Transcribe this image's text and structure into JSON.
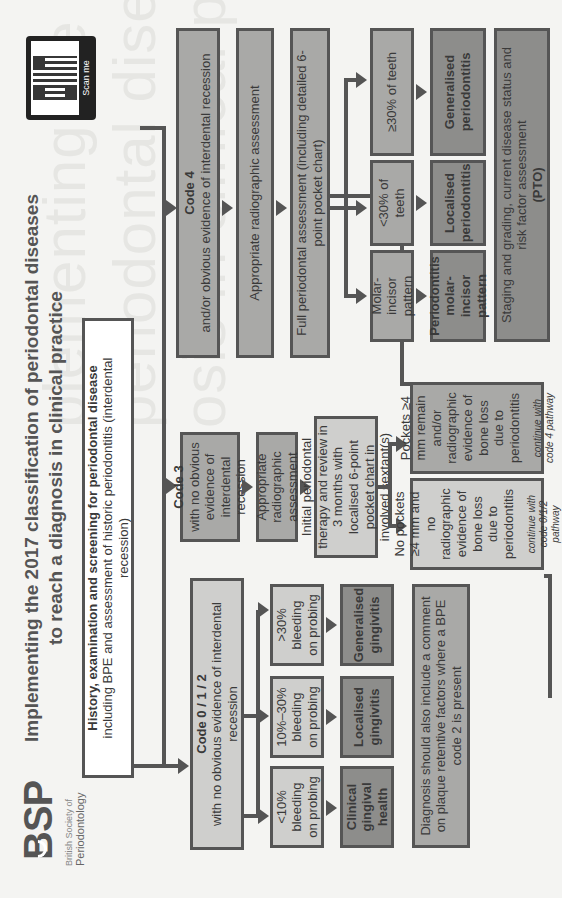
{
  "header": {
    "title_line1": "Implementing the 2017 classification of periodontal diseases",
    "title_line2": "to reach a diagnosis in clinical practice",
    "logo_letters": "BSP",
    "logo_sub1": "British Society of",
    "logo_sub2": "Periodontology",
    "qr_label": "Scan me"
  },
  "ghost_text": [
    "plementing the 2017 classificatio",
    "periodontal diseases to reach a",
    "osis in clinical practice"
  ],
  "start": {
    "title": "History, examination and screening for periodontal disease",
    "subtitle": "including BPE and assessment of historic periodontitis (interdental recession)"
  },
  "code012": {
    "title": "Code 0 / 1 / 2",
    "subtitle": "with no obvious evidence of interdental recession",
    "branches": [
      {
        "criterion": "<10% bleeding on probing",
        "result": "Clinical gingival health"
      },
      {
        "criterion": "10%–30% bleeding on probing",
        "result": "Localised gingivitis"
      },
      {
        "criterion": ">30% bleeding on probing",
        "result": "Generalised gingivitis"
      }
    ],
    "note": "Diagnosis should also include a comment on plaque retentive factors where a BPE code 2 is present"
  },
  "code3": {
    "title": "Code 3",
    "subtitle": "with no obvious evidence of interdental recession",
    "radiographic": "Appropriate radiographic assessment",
    "therapy": "Initial periodontal therapy and review in 3 months with localised 6-point pocket chart in involved sextant(s)",
    "outcomes": [
      {
        "text": "No pockets ≥4 mm and no radiographic evidence of bone loss due to periodontitis",
        "note": "continue with code 0/1/2 pathway"
      },
      {
        "text": "Pockets ≥4 mm remain and/or radiographic evidence of bone loss due to periodontitis",
        "note": "continue with code 4 pathway"
      }
    ]
  },
  "code4": {
    "title": "Code 4",
    "subtitle": "and/or obvious evidence of interdental recession",
    "radiographic": "Appropriate radiographic assessment",
    "full_assessment": "Full periodontal assessment (including detailed 6-point pocket chart)",
    "branches": [
      {
        "criterion": "Molar-incisor pattern",
        "result": "Periodontitis molar-incisor pattern"
      },
      {
        "criterion": "<30% of teeth",
        "result": "Localised periodontitis"
      },
      {
        "criterion": "≥30% of teeth",
        "result": "Generalised periodontitis"
      }
    ],
    "staging": "Staging and grading, current disease status and risk factor assessment",
    "staging_bold": "(PTO)"
  },
  "colors": {
    "light_box": "#cfcfcd",
    "mid_box": "#a9a9a7",
    "dark_box": "#8d8d8b",
    "border": "#555555",
    "background": "#f4f4f2"
  }
}
